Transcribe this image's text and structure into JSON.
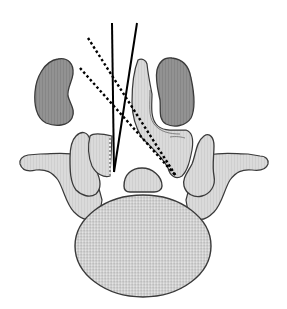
{
  "figure": {
    "background": "#ffffff",
    "colors": {
      "kidney_fill": "#8f8f8f",
      "bone_fill": "#d9d9d9",
      "body_fill": "#d4d4d4",
      "outline": "#3a3a3a",
      "needle": "#000000"
    },
    "structures": [
      {
        "name": "left-kidney"
      },
      {
        "name": "right-kidney"
      },
      {
        "name": "vertebral-body"
      },
      {
        "name": "left-transverse-process"
      },
      {
        "name": "right-transverse-process"
      },
      {
        "name": "spinal-canal-segment"
      },
      {
        "name": "lamina-left"
      },
      {
        "name": "spinous-process"
      }
    ],
    "trajectories": [
      {
        "name": "solid-vertical",
        "style": "solid"
      },
      {
        "name": "solid-oblique",
        "style": "solid"
      },
      {
        "name": "dotted-upper",
        "style": "dotted"
      },
      {
        "name": "dotted-lower",
        "style": "dotted"
      }
    ]
  }
}
